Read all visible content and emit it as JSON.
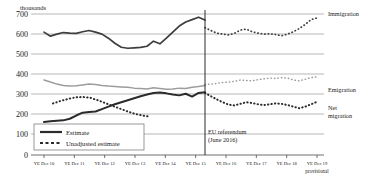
{
  "chart_data": {
    "type": "line",
    "title": "",
    "unit_label": "thousands",
    "xlabel": "",
    "ylabel": "",
    "ylim": [
      0,
      700
    ],
    "yticks": [
      0,
      100,
      200,
      300,
      400,
      500,
      600,
      700
    ],
    "grid": true,
    "legend_position": "inside-bottom-left",
    "categories": [
      "YE Dec 10",
      "YE Dec 11",
      "YE Dec 12",
      "YE Dec 13",
      "YE Dec 14",
      "YE Dec 15",
      "YE Dec 16",
      "YE Dec 17",
      "YE Dec 18",
      "YE Dec 19"
    ],
    "last_category_note": "provisional",
    "annotations": [
      {
        "name": "eu-referendum",
        "line1": "EU referendum",
        "line2": "(June 2016)",
        "at_category": "YE Dec 15.5"
      }
    ],
    "legend": [
      {
        "label": "Estimate",
        "style": "solid"
      },
      {
        "label": "Unadjusted estimate",
        "style": "dotted"
      }
    ],
    "series": [
      {
        "name": "Immigration",
        "color": "#3d3d3d",
        "estimate": [
          610,
          590,
          600,
          608,
          605,
          604,
          612,
          618,
          610,
          600,
          580,
          555,
          535,
          530,
          532,
          534,
          540,
          565,
          552,
          580,
          610,
          640,
          660,
          672,
          684,
          670
        ],
        "unadjusted": [
          632,
          618,
          605,
          600,
          596,
          604,
          620,
          625,
          612,
          605,
          600,
          602,
          598,
          592,
          600,
          612,
          628,
          648,
          672,
          681
        ]
      },
      {
        "name": "Emigration",
        "color": "#9c9c9c",
        "estimate": [
          372,
          362,
          352,
          345,
          342,
          344,
          348,
          352,
          350,
          345,
          342,
          340,
          338,
          336,
          332,
          330,
          328,
          334,
          330,
          326,
          328,
          332,
          330,
          336,
          340,
          345
        ],
        "unadjusted": [
          350,
          352,
          356,
          360,
          362,
          366,
          372,
          370,
          368,
          374,
          378,
          382,
          380,
          384,
          382,
          372,
          368,
          376,
          384,
          388
        ]
      },
      {
        "name": "Net migration",
        "color": "#2b2b2b",
        "estimate": [
          164,
          168,
          170,
          172,
          180,
          196,
          210,
          214,
          216,
          228,
          240,
          252,
          262,
          272,
          282,
          292,
          300,
          308,
          310,
          306,
          300,
          296,
          304,
          290,
          308,
          312
        ],
        "unadjusted": [
          256,
          268,
          278,
          286,
          288,
          284,
          272,
          258,
          244,
          230,
          216,
          204,
          196,
          190
        ],
        "unadjusted_right": [
          308,
          292,
          276,
          262,
          250,
          246,
          254,
          262,
          258,
          252,
          248,
          252,
          256,
          254,
          248,
          240,
          232,
          240,
          252,
          264
        ]
      }
    ]
  }
}
